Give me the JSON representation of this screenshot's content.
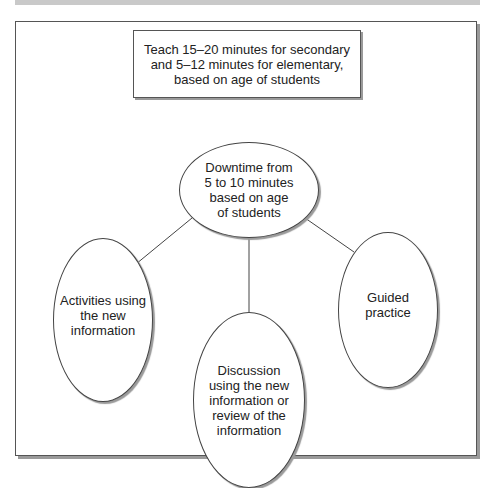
{
  "diagram": {
    "top_box": {
      "text": "Teach 15–20 minutes for secondary\nand 5–12 minutes for elementary,\nbased on age of students"
    },
    "central_node": {
      "text": "Downtime from\n5 to 10 minutes\nbased on age\nof students"
    },
    "child_nodes": [
      {
        "id": "left",
        "text": "Activities using\nthe new\ninformation"
      },
      {
        "id": "middle",
        "text": "Discussion\nusing the new\ninformation or\nreview of the\ninformation"
      },
      {
        "id": "right",
        "text": "Guided practice"
      }
    ],
    "edges": [
      {
        "from": "central",
        "to": "left"
      },
      {
        "from": "central",
        "to": "middle"
      },
      {
        "from": "central",
        "to": "right"
      }
    ],
    "colors": {
      "border": "#444444",
      "shadow": "#9a9a9a",
      "topbar": "#c9c9c9",
      "background": "#ffffff"
    }
  }
}
